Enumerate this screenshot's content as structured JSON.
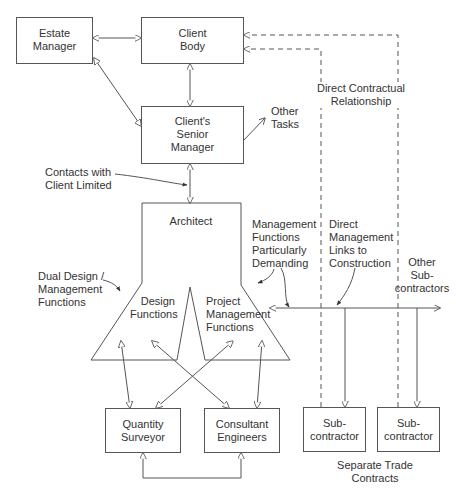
{
  "nodes": {
    "estate_manager": {
      "line1": "Estate",
      "line2": "Manager"
    },
    "client_body": {
      "line1": "Client",
      "line2": "Body"
    },
    "senior_manager": {
      "line1": "Client's",
      "line2": "Senior",
      "line3": "Manager"
    },
    "architect": {
      "label": "Architect"
    },
    "design_functions": {
      "line1": "Design",
      "line2": "Functions"
    },
    "project_management": {
      "line1": "Project",
      "line2": "Management",
      "line3": "Functions"
    },
    "quantity_surveyor": {
      "line1": "Quantity",
      "line2": "Surveyor"
    },
    "consultant_engineers": {
      "line1": "Consultant",
      "line2": "Engineers"
    },
    "subcontractor_1": {
      "line1": "Sub-",
      "line2": "contractor"
    },
    "subcontractor_2": {
      "line1": "Sub-",
      "line2": "contractor"
    }
  },
  "annotations": {
    "other_tasks": {
      "line1": "Other",
      "line2": "Tasks"
    },
    "direct_contractual": {
      "line1": "Direct Contractual",
      "line2": "Relationship"
    },
    "contacts_limited": {
      "line1": "Contacts with",
      "line2": "Client Limited"
    },
    "mgmt_demanding": {
      "line1": "Management",
      "line2": "Functions",
      "line3": "Particularly",
      "line4": "Demanding"
    },
    "direct_mgmt_links": {
      "line1": "Direct",
      "line2": "Management",
      "line3": "Links to",
      "line4": "Construction"
    },
    "other_subcontractors": {
      "line1": "Other",
      "line2": "Sub-",
      "line3": "contractors"
    },
    "dual_design": {
      "line1": "Dual Design /",
      "line2": "Management",
      "line3": "Functions"
    },
    "separate_trade": {
      "line1": "Separate Trade",
      "line2": "Contracts"
    }
  },
  "colors": {
    "line": "#555555",
    "text": "#333333",
    "background": "#ffffff"
  }
}
